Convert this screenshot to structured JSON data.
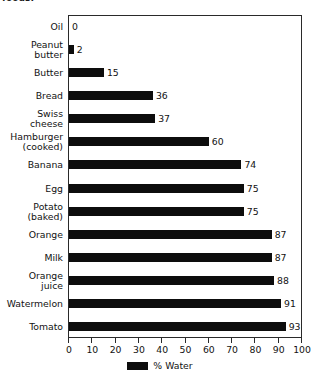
{
  "caption_fragment": "foods:",
  "chart_data": {
    "type": "bar",
    "orientation": "horizontal",
    "title": "",
    "xlabel": "",
    "ylabel": "",
    "xlim": [
      0,
      100
    ],
    "xticks": [
      0,
      10,
      20,
      30,
      40,
      50,
      60,
      70,
      80,
      90,
      100
    ],
    "grid": false,
    "legend": {
      "position": "bottom-center",
      "entries": [
        {
          "label": "% Water",
          "color": "#0d0d0d"
        }
      ]
    },
    "series_name": "% Water",
    "bar_color": "#0d0d0d",
    "categories": [
      "Oil",
      "Peanut butter",
      "Butter",
      "Bread",
      "Swiss cheese",
      "Hamburger (cooked)",
      "Banana",
      "Egg",
      "Potato (baked)",
      "Orange",
      "Milk",
      "Orange juice",
      "Watermelon",
      "Tomato"
    ],
    "category_lines": [
      [
        "Oil"
      ],
      [
        "Peanut",
        "butter"
      ],
      [
        "Butter"
      ],
      [
        "Bread"
      ],
      [
        "Swiss",
        "cheese"
      ],
      [
        "Hamburger",
        "(cooked)"
      ],
      [
        "Banana"
      ],
      [
        "Egg"
      ],
      [
        "Potato",
        "(baked)"
      ],
      [
        "Orange"
      ],
      [
        "Milk"
      ],
      [
        "Orange",
        "juice"
      ],
      [
        "Watermelon"
      ],
      [
        "Tomato"
      ]
    ],
    "values": [
      0,
      2,
      15,
      36,
      37,
      60,
      74,
      75,
      75,
      87,
      87,
      88,
      91,
      93
    ],
    "value_labels": [
      "0",
      "2",
      "15",
      "36",
      "37",
      "60",
      "74",
      "75",
      "75",
      "87",
      "87",
      "88",
      "91",
      "93"
    ]
  }
}
